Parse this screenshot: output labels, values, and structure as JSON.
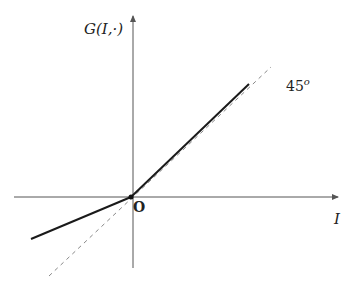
{
  "diagram": {
    "type": "piecewise-linear-function-plot",
    "y_axis_label": "G(I,·)",
    "x_axis_label": "I",
    "origin_label": "O",
    "reference_line_label": "45",
    "reference_line_degree_symbol": "o",
    "colors": {
      "axes": "#555555",
      "solid_line": "#1a1a1a",
      "dashed_line": "#888888",
      "background": "#ffffff"
    },
    "elements": {
      "origin_px": [
        131,
        197
      ],
      "x_axis": {
        "from": [
          14,
          197
        ],
        "to": [
          340,
          197
        ],
        "arrow": "right"
      },
      "y_axis": {
        "from": [
          133,
          268
        ],
        "to": [
          133,
          14
        ],
        "arrow": "up"
      },
      "solid_segment_positive": {
        "from": [
          131,
          197
        ],
        "to": [
          249,
          84
        ],
        "slope": "≈1"
      },
      "solid_segment_negative": {
        "from": [
          31,
          239
        ],
        "to": [
          131,
          197
        ],
        "slope": "<1"
      },
      "dashed_45_line": {
        "from": [
          49,
          276
        ],
        "to": [
          271,
          67
        ]
      }
    }
  }
}
